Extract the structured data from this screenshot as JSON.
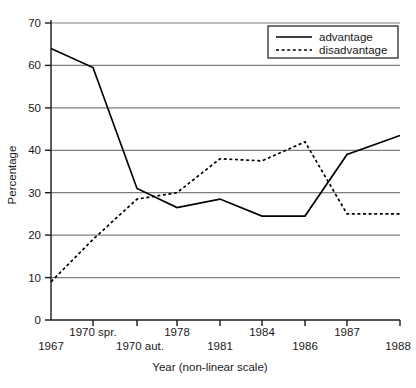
{
  "chart_data": {
    "type": "line",
    "title": "",
    "xlabel": "Year (non-linear scale)",
    "ylabel": "Percentage",
    "x_tick_labels": [
      "1967",
      "1970 spr.",
      "1970 aut.",
      "1978",
      "1981",
      "1984",
      "1986",
      "1987",
      "1988"
    ],
    "x_tick_rows": [
      1,
      0,
      1,
      0,
      1,
      0,
      1,
      0,
      1
    ],
    "y_tick_labels": [
      "0",
      "10",
      "20",
      "30",
      "40",
      "50",
      "60",
      "70"
    ],
    "y_ticks": [
      0,
      10,
      20,
      30,
      40,
      50,
      60,
      70
    ],
    "ylim": [
      0,
      70
    ],
    "grid": "horizontal",
    "legend_position": "top-right",
    "series": [
      {
        "name": "advantage",
        "style": "solid",
        "color": "#000000",
        "values": [
          64,
          59.5,
          31,
          26.5,
          28.5,
          24.5,
          24.5,
          39,
          43.5
        ]
      },
      {
        "name": "disadvantage",
        "style": "dotted",
        "color": "#000000",
        "values": [
          9,
          19,
          28.5,
          30,
          38,
          37.5,
          42,
          25,
          25
        ]
      }
    ],
    "legend_entries": [
      "advantage",
      "disadvantage"
    ]
  },
  "colors": {
    "axis": "#1a1a1a",
    "gridline": "#808080",
    "line": "#000000",
    "background": "#ffffff"
  }
}
